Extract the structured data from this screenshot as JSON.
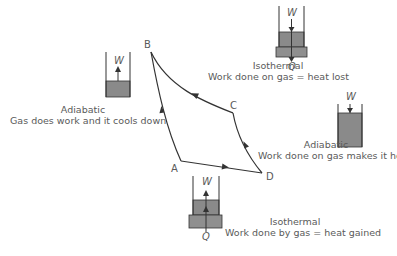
{
  "diagram": {
    "type": "Carnot cycle (P-V loop) with piston cylinder illustrations",
    "colors": {
      "line": "#333333",
      "gas": "#8a8a8a",
      "reservoir": "#8f8f8f",
      "text": "#5a5a5a"
    },
    "points": [
      {
        "id": "B",
        "label": "B"
      },
      {
        "id": "C",
        "label": "C"
      },
      {
        "id": "A",
        "label": "A"
      },
      {
        "id": "D",
        "label": "D"
      }
    ],
    "processes": [
      {
        "id": "adiabatic-expansion",
        "title": "Adiabatic",
        "description": "Gas does work and it cools down",
        "work_label": "W",
        "from": "B",
        "to": "A"
      },
      {
        "id": "isothermal-compression",
        "title": "Isothermal",
        "description": "Work done on gas = heat lost",
        "work_label": "W",
        "heat_label": "Q",
        "from": "C",
        "to": "B"
      },
      {
        "id": "adiabatic-compression",
        "title": "Adiabatic",
        "description": "Work done on gas makes it hot",
        "work_label": "W",
        "from": "D",
        "to": "C"
      },
      {
        "id": "isothermal-expansion",
        "title": "Isothermal",
        "description": "Work done by gas = heat gained",
        "work_label": "W",
        "heat_label": "Q",
        "from": "A",
        "to": "D"
      }
    ]
  }
}
